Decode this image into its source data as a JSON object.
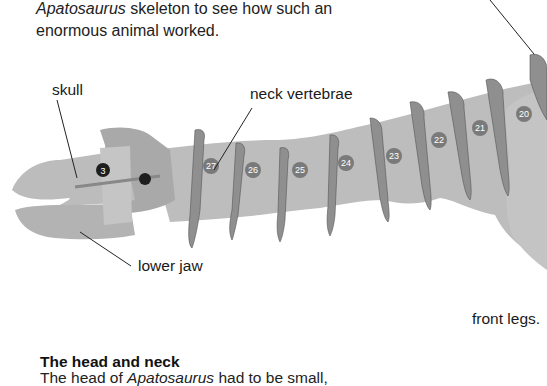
{
  "intro": {
    "line1_italic": "Apatosaurus",
    "line1_rest": " skeleton to see how such an",
    "line2": "enormous animal worked."
  },
  "labels": {
    "skull": "skull",
    "neck_vertebrae": "neck vertebrae",
    "lower_jaw": "lower jaw",
    "front_legs": "front legs."
  },
  "skull_badge": "3",
  "vertebrae": [
    "27",
    "26",
    "25",
    "24",
    "23",
    "22",
    "21",
    "20"
  ],
  "section": {
    "heading": "The head and neck",
    "text_prefix": "The head of ",
    "text_italic": "Apatosaurus",
    "text_suffix": " had to be small,"
  },
  "colors": {
    "bone": "#b9b9b9",
    "bone_dark": "#8e8e8e",
    "badge": "#7a7a7a",
    "skull_badge": "#1e1e1e"
  }
}
